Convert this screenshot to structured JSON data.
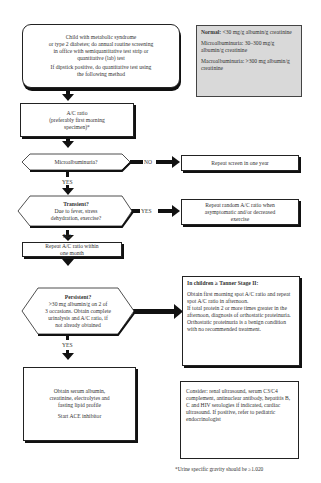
{
  "start_box": {
    "lines": [
      "Child with metabolic syndrome",
      "or type 2 diabetes; do annual routine screening",
      "in office with semiquantitative test strip or",
      "quantitative (lab) test"
    ],
    "line2": [
      "If dipstick positive, do quantitative test using",
      "the following method"
    ]
  },
  "legend_box": {
    "normal_label": "Normal:",
    "normal_text": " <30 mg/g albumin/g creatinine",
    "micro": "Microalbuminuria: 30–300 mg/g albumin/g creatinine",
    "macro": "Macroalbuminuria: >300 mg albumin/g creatinine"
  },
  "ac_ratio_box": {
    "lines": [
      "A/C ratio",
      "(preferably first morning",
      "specimen)*"
    ]
  },
  "micro_decision": {
    "text": "Microalbuminuria?",
    "no_label": "NO",
    "yes_label": "YES"
  },
  "repeat_year_box": {
    "text": "Repeat screen in one year"
  },
  "transient_decision": {
    "title": "Transient?",
    "lines": [
      "Due to fever, stress",
      "dehydration, exercise?"
    ],
    "yes_label": "YES",
    "no_label": "NO"
  },
  "repeat_random_box": {
    "lines": [
      "Repeat random A/C ratio when",
      "asymptomatic and/or decreased",
      "exercise"
    ]
  },
  "repeat_month_box": {
    "lines": [
      "Repeat A/C ratio within",
      "one month"
    ]
  },
  "persistent_decision": {
    "title": "Persistent?",
    "lines": [
      ">30 mg albumin/g on 2 of",
      "3 occasions. Obtain complete",
      "urinalysis and A/C ratio, if",
      "not already obtained"
    ],
    "yes_label": "YES"
  },
  "tanner_box": {
    "title": "In children ≥ Tanner Stage II:",
    "p1": "Obtain first morning spot A/C ratio and repeat spot A/C ratio in afternoon.",
    "p2": "If total protein 2 or more times greater in the afternoon, diagnosis of orthostatic proteinuria.",
    "p3": "Orthostatic proteinuria is a benign condition with no recommended treatment."
  },
  "serum_box": {
    "lines": [
      "Obtain serum albumin,",
      "creatinine, electrolytes and",
      "fasting lipid profile"
    ],
    "ace": "Start ACE inhibitor"
  },
  "consider_box": {
    "text": "Consider: renal ultrasound, serum C3/C4 complement, antinuclear antibody, hepatitis B, C and HIV serologies if indicated, cardiac ultrasound. If positive, refer to pediatric endocrinologist"
  },
  "footnote": "*Urine specific gravity should be ≥1.020"
}
